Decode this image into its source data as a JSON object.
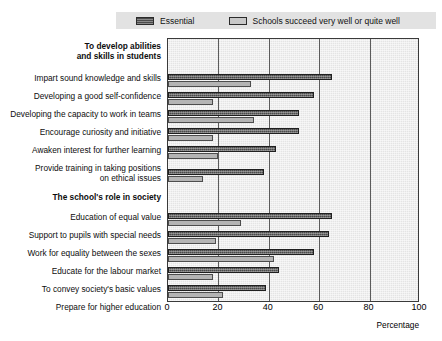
{
  "legend": {
    "entries": [
      {
        "label": "Essential",
        "swatch": "dark-hatch",
        "color": "#4a4a4a"
      },
      {
        "label": "Schools succeed very well or quite well",
        "swatch": "light-solid",
        "color": "#c8c8c8"
      }
    ],
    "background": "#e2e2e2"
  },
  "axis": {
    "title": "Percentage",
    "ticks": [
      "0",
      "20",
      "40",
      "60",
      "80",
      "100"
    ]
  },
  "chart_data": {
    "type": "bar",
    "orientation": "horizontal",
    "title": "",
    "xlabel": "Percentage",
    "ylabel": "",
    "xlim": [
      0,
      100
    ],
    "grid": true,
    "legend_position": "top",
    "series": [
      {
        "name": "Essential",
        "color": "#4a4a4a"
      },
      {
        "name": "Schools succeed very well or quite well",
        "color": "#b4b4b4"
      }
    ],
    "groups": [
      {
        "group_label": "To develop abilities\nand skills in students",
        "rows": [
          {
            "category": "Impart sound knowledge and skills",
            "values": [
              65,
              33
            ]
          },
          {
            "category": "Developing a good self-confidence",
            "values": [
              58,
              18
            ]
          },
          {
            "category": "Developing the capacity to work in teams",
            "values": [
              52,
              34
            ]
          },
          {
            "category": "Encourage curiosity and initiative",
            "values": [
              52,
              18
            ]
          },
          {
            "category": "Awaken interest for further learning",
            "values": [
              43,
              20
            ]
          },
          {
            "category": "Provide training in taking positions\non ethical issues",
            "values": [
              38,
              14
            ]
          }
        ]
      },
      {
        "group_label": "The school's role in society",
        "rows": [
          {
            "category": "Education of equal value",
            "values": [
              65,
              29
            ]
          },
          {
            "category": "Support to pupils with special needs",
            "values": [
              64,
              19
            ]
          },
          {
            "category": "Work for equality between the sexes",
            "values": [
              58,
              42
            ]
          },
          {
            "category": "Educate for the labour market",
            "values": [
              44,
              18
            ]
          },
          {
            "category": "To convey society's basic values",
            "values": [
              39,
              22
            ]
          },
          {
            "category": "Prepare for higher education",
            "values": [
              33,
              32
            ]
          }
        ]
      }
    ],
    "categories": [
      "Impart sound knowledge and skills",
      "Developing a good self-confidence",
      "Developing the capacity to work in teams",
      "Encourage curiosity and initiative",
      "Awaken interest for further learning",
      "Provide training in taking positions on ethical issues",
      "Education of equal value",
      "Support to pupils with special needs",
      "Work for equality between the sexes",
      "Educate for the labour market",
      "To convey society's basic values",
      "Prepare for higher education"
    ],
    "values": {
      "Essential": [
        65,
        58,
        52,
        52,
        43,
        38,
        65,
        64,
        58,
        44,
        39,
        33
      ],
      "Schools succeed very well or quite well": [
        33,
        18,
        34,
        18,
        20,
        14,
        29,
        19,
        42,
        18,
        22,
        32
      ]
    }
  }
}
